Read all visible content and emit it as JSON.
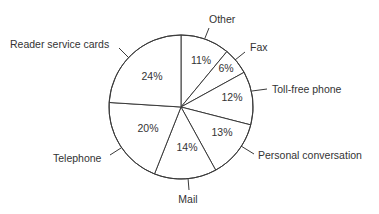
{
  "chart_data": {
    "type": "pie",
    "title": "",
    "start_angle": "12 o'clock",
    "direction": "clockwise",
    "categories": [
      "Other",
      "Fax",
      "Toll-free phone",
      "Personal conversation",
      "Mail",
      "Telephone",
      "Reader service cards"
    ],
    "values": [
      11,
      6,
      12,
      13,
      14,
      20,
      24
    ],
    "value_labels": [
      "11%",
      "6%",
      "12%",
      "13%",
      "14%",
      "20%",
      "24%"
    ],
    "unit": "%",
    "legend": "none (outside labels with leader lines)"
  },
  "slices": [
    {
      "label": "Other",
      "value": 11,
      "pct_label": "11%",
      "color": "#ffffff",
      "label_pos": {
        "x": 209,
        "y": 23,
        "anchor": "start"
      },
      "leader": [
        [
          205,
          38
        ],
        [
          209,
          28
        ]
      ],
      "pct_pos": {
        "x": 201,
        "y": 64
      }
    },
    {
      "label": "Fax",
      "value": 6,
      "pct_label": "6%",
      "color": "#ffffff",
      "label_pos": {
        "x": 250,
        "y": 51,
        "anchor": "start"
      },
      "leader": [
        [
          235,
          60
        ],
        [
          245,
          52
        ]
      ],
      "pct_pos": {
        "x": 226,
        "y": 72
      }
    },
    {
      "label": "Toll-free phone",
      "value": 12,
      "pct_label": "12%",
      "color": "#ffffff",
      "label_pos": {
        "x": 272,
        "y": 93,
        "anchor": "start"
      },
      "leader": [
        [
          252,
          91
        ],
        [
          267,
          89
        ]
      ],
      "pct_pos": {
        "x": 232,
        "y": 101
      }
    },
    {
      "label": "Personal conversation",
      "value": 13,
      "pct_label": "13%",
      "color": "#ffffff",
      "label_pos": {
        "x": 258,
        "y": 159,
        "anchor": "start"
      },
      "leader": [
        [
          241,
          146
        ],
        [
          254,
          154
        ]
      ],
      "pct_pos": {
        "x": 222,
        "y": 136
      }
    },
    {
      "label": "Mail",
      "value": 14,
      "pct_label": "14%",
      "color": "#ffffff",
      "label_pos": {
        "x": 188,
        "y": 203,
        "anchor": "middle"
      },
      "leader": [
        [
          188,
          178
        ],
        [
          189,
          190
        ]
      ],
      "pct_pos": {
        "x": 187,
        "y": 151
      }
    },
    {
      "label": "Telephone",
      "value": 20,
      "pct_label": "20%",
      "color": "#ffffff",
      "label_pos": {
        "x": 53,
        "y": 162,
        "anchor": "start"
      },
      "leader": [
        [
          121,
          148
        ],
        [
          110,
          155
        ]
      ],
      "pct_pos": {
        "x": 148,
        "y": 132
      }
    },
    {
      "label": "Reader service cards",
      "value": 24,
      "pct_label": "24%",
      "color": "#ffffff",
      "label_pos": {
        "x": 10,
        "y": 48,
        "anchor": "start"
      },
      "leader": [
        [
          129,
          58
        ],
        [
          119,
          48
        ]
      ],
      "pct_pos": {
        "x": 152,
        "y": 80
      }
    }
  ],
  "geometry": {
    "cx": 181,
    "cy": 107,
    "r": 72
  },
  "colors": {
    "stroke": "#3a3a3a",
    "text": "#333333",
    "fill": "#ffffff"
  }
}
